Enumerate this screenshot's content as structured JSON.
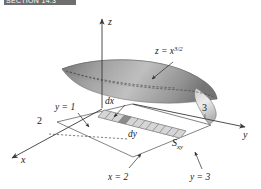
{
  "header": {
    "banner_text": "SECTION 14.3"
  },
  "figure": {
    "caption_present": false,
    "axes": [
      {
        "name": "z-axis",
        "label": "z",
        "direction": "up"
      },
      {
        "name": "y-axis",
        "label": "y",
        "direction": "right"
      },
      {
        "name": "x-axis",
        "label": "x",
        "direction": "lower-left"
      }
    ],
    "tick_labels": [
      {
        "name": "x-tick-2",
        "label": "2",
        "axis": "x"
      },
      {
        "name": "y-tick-3",
        "label": "3",
        "axis": "y"
      }
    ],
    "annotations": [
      {
        "name": "surface-equation",
        "label": "z = x",
        "exponent": "3/2"
      },
      {
        "name": "plane-y-equals-1",
        "label": "y = 1"
      },
      {
        "name": "differential-dx",
        "label": "dx"
      },
      {
        "name": "differential-dy",
        "label": "dy"
      },
      {
        "name": "region-label",
        "label": "S",
        "subscript": "xy"
      },
      {
        "name": "boundary-x-equals-2",
        "label": "x = 2"
      },
      {
        "name": "boundary-y-equals-3",
        "label": "y = 3"
      }
    ],
    "strip": {
      "cell_count": 12,
      "highlighted_cell_index": 3
    },
    "colors": {
      "banner": "#6e6e6e",
      "axis": "#3a3a3a",
      "surface_light": "#f2f2f2",
      "surface_mid": "#bdbdbd",
      "surface_dark": "#7a7a7a",
      "strip_fill": "#d6d6d6",
      "strip_highlight": "#8a8a8a",
      "text": "#1a1a1a",
      "background": "#ffffff"
    }
  }
}
